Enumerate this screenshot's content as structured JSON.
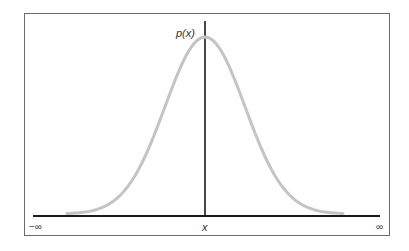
{
  "diagram": {
    "y_label": "p(x)",
    "x_label": "x",
    "x_left_label": "−∞",
    "x_right_label": "∞",
    "colors": {
      "curve": "#c4c4c4",
      "axes": "#1a1a1a",
      "frame": "#6b6b6b"
    }
  },
  "chart_data": {
    "type": "line",
    "title": "",
    "xlabel": "x",
    "ylabel": "p(x)",
    "x_range": [
      "-∞",
      "∞"
    ],
    "series": [
      {
        "name": "p(x)",
        "shape": "gaussian",
        "mean": 0,
        "std": 1
      }
    ],
    "grid": false
  }
}
